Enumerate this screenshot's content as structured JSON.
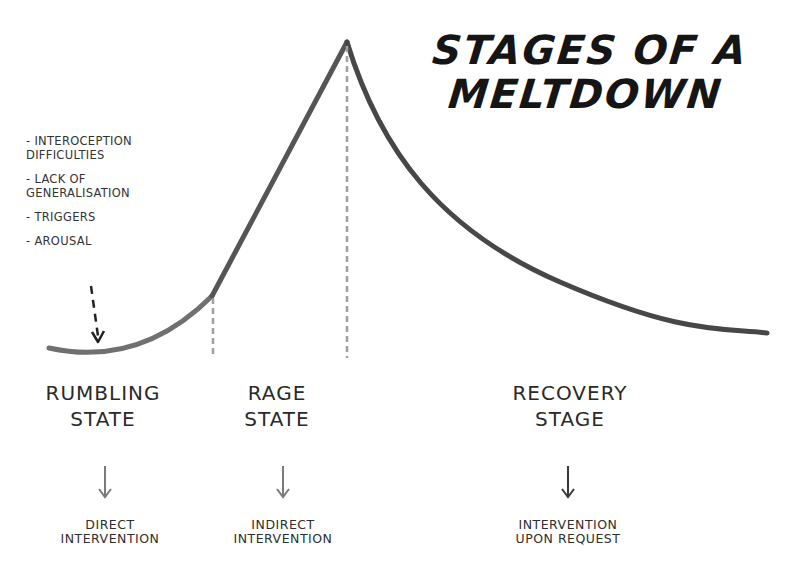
{
  "title": {
    "line1": "STAGES OF A",
    "line2": "MELTDOWN"
  },
  "factors": [
    {
      "line1": "- INTEROCEPTION",
      "line2": "DIFFICULTIES"
    },
    {
      "line1": "- LACK OF",
      "line2": "GENERALISATION"
    },
    {
      "line1": "- TRIGGERS",
      "line2": ""
    },
    {
      "line1": "- AROUSAL",
      "line2": ""
    }
  ],
  "stages": [
    {
      "line1": "RUMBLING",
      "line2": "STATE",
      "intervention_line1": "DIRECT",
      "intervention_line2": "INTERVENTION"
    },
    {
      "line1": "RAGE",
      "line2": "STATE",
      "intervention_line1": "INDIRECT",
      "intervention_line2": "INTERVENTION"
    },
    {
      "line1": "RECOVERY",
      "line2": "STAGE",
      "intervention_line1": "INTERVENTION",
      "intervention_line2": "UPON REQUEST"
    }
  ],
  "colors": {
    "rumbling_curve": "#6e6e6e",
    "rage_curve": "#4a4a4a",
    "recovery_curve": "#454545",
    "divider_dash": "#9a9a9a",
    "arrow_light": "#7a7a7a",
    "arrow_dark": "#3a3a3a"
  },
  "icons": {
    "factor_arrow": "dashed-down-arrow-icon",
    "stage_arrow": "down-arrow-icon"
  }
}
